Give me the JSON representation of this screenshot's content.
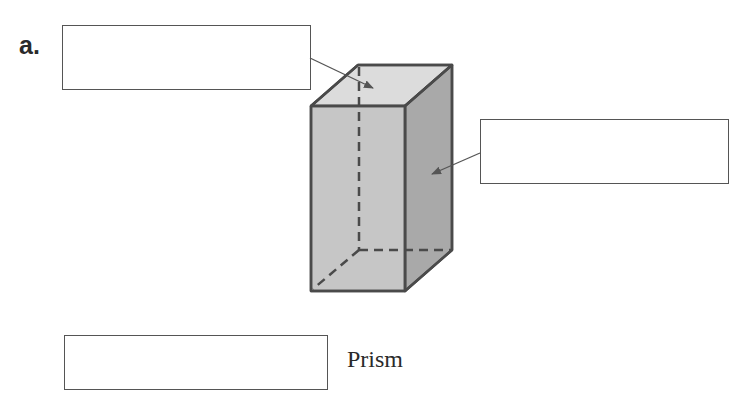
{
  "question": {
    "part_label": "a.",
    "answer_boxes": [
      {
        "id": "top-face-label",
        "value": "",
        "points_to": "top face"
      },
      {
        "id": "side-face-label",
        "value": "",
        "points_to": "side face"
      },
      {
        "id": "prism-type",
        "value": ""
      }
    ],
    "shape_name_suffix": "Prism"
  },
  "figure": {
    "shape": "rectangular prism",
    "colors": {
      "front_face": "#c8c8c8",
      "top_face": "#dcdcdc",
      "side_face": "#a8a8a8",
      "edges": "#4a4a4a",
      "arrows": "#555555"
    }
  }
}
